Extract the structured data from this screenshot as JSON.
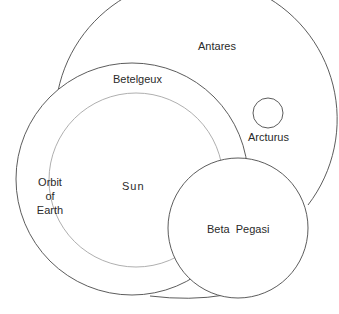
{
  "diagram": {
    "labels": {
      "antares": "Antares",
      "betelgeux": "Betelgeux",
      "arcturus": "Arcturus",
      "orbit_line1": "Orbit",
      "orbit_line2": "of",
      "orbit_line3": "Earth",
      "sun": "Sun",
      "beta_pegasi": "Beta  Pegasi"
    },
    "colors": {
      "stroke": "#4a4a4a",
      "orbit_stroke": "#9a9a9a",
      "background": "#ffffff"
    }
  }
}
